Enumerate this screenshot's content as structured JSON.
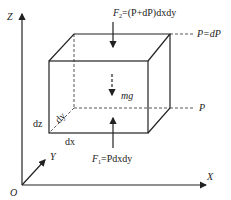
{
  "diagram": {
    "axes": {
      "origin": "O",
      "x": "X",
      "y": "Y",
      "z": "Z"
    },
    "forces": {
      "top": {
        "symbol": "F",
        "sub": "2",
        "expr": "=(P+dP)dxdy"
      },
      "bottom": {
        "symbol": "F",
        "sub": "1",
        "expr": "=Pdxdy"
      },
      "weight": "mg"
    },
    "pressures": {
      "top": "P=dP",
      "bottom": "P"
    },
    "dimensions": {
      "dx": "dx",
      "dy": "dy",
      "dz": "dz"
    },
    "colors": {
      "line": "#222222",
      "background": "#ffffff"
    }
  }
}
